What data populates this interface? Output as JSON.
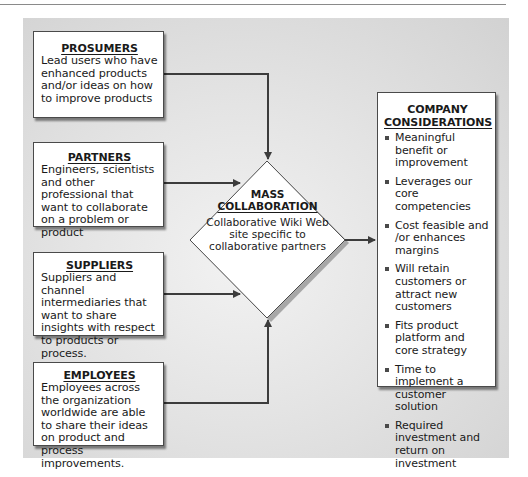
{
  "diagram": {
    "type": "flow-into-hub",
    "sources": [
      {
        "id": "prosumers",
        "title": "PROSUMERS",
        "body": "Lead users who have enhanced products and/or ideas on how to improve products"
      },
      {
        "id": "partners",
        "title": "PARTNERS",
        "body": "Engineers, scientists and other professional that want to collaborate on a problem or product"
      },
      {
        "id": "suppliers",
        "title": "SUPPLIERS",
        "body": "Suppliers and channel intermediaries that want to share insights with respect to products or process."
      },
      {
        "id": "employees",
        "title": "EMPLOYEES",
        "body": "Employees across the organization worldwide are able to share their ideas on product and process improvements."
      }
    ],
    "hub": {
      "title_line1": "MASS",
      "title_line2": "COLLABORATION",
      "body": "Collaborative Wiki Web site specific to collaborative partners"
    },
    "output": {
      "title_line1": "COMPANY",
      "title_line2": "CONSIDERATIONS",
      "items": [
        "Meaningful benefit or improvement",
        "Leverages our core competencies",
        "Cost feasible and /or enhances margins",
        "Will retain customers or attract new customers",
        "Fits product platform and core strategy",
        "Time to implement a customer solution",
        "Required investment and return on investment"
      ]
    },
    "edges": [
      {
        "from": "prosumers",
        "to": "hub"
      },
      {
        "from": "partners",
        "to": "hub"
      },
      {
        "from": "suppliers",
        "to": "hub"
      },
      {
        "from": "employees",
        "to": "hub"
      },
      {
        "from": "hub",
        "to": "output"
      }
    ],
    "colors": {
      "line": "#3c3c3c",
      "box_fill": "#ffffff",
      "panel": "#dcdcdc"
    }
  }
}
